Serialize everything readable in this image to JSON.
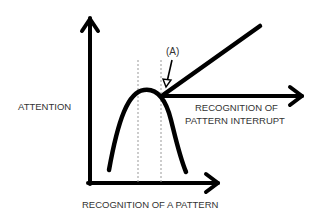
{
  "diagram": {
    "labels": {
      "y_axis": "ATTENTION",
      "x_axis": "RECOGNITION OF A PATTERN",
      "branch_line1": "RECOGNITION OF",
      "branch_line2": "PATTERN INTERRUPT",
      "point_marker": "(A)"
    },
    "colors": {
      "stroke": "#000000",
      "text": "#333333",
      "guide": "#999999",
      "background": "#ffffff"
    }
  }
}
